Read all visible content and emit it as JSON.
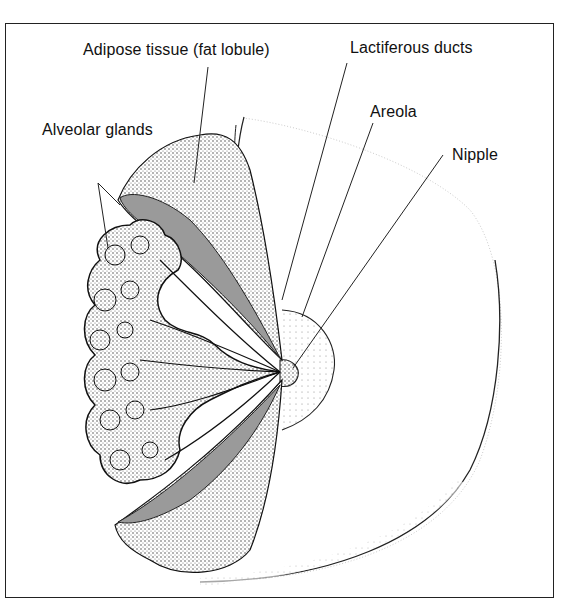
{
  "figure": {
    "labels": {
      "adipose": "Adipose tissue (fat lobule)",
      "lactiferous": "Lactiferous ducts",
      "areola": "Areola",
      "nipple": "Nipple",
      "alveolar": "Alveolar glands"
    },
    "colors": {
      "ink": "#111111",
      "duct_shading": "#9a9a9a",
      "frame": "#222222",
      "background": "#ffffff"
    }
  }
}
